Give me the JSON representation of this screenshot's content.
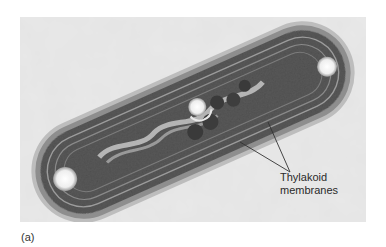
{
  "figure": {
    "panel_label": "(a)",
    "annotations": [
      {
        "text_lines": [
          "Thylakoid",
          "membranes"
        ]
      }
    ]
  },
  "colors": {
    "background": "#e6e6e6",
    "cell_wall": "#9a9a9a",
    "cytoplasm": "#4a4a4a",
    "granule": "#3a3a3a",
    "vacuole": "#f4f4f4",
    "leader_line": "#333333"
  }
}
